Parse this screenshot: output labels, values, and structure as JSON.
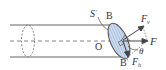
{
  "diagram": {
    "labels": {
      "s_prime": "S",
      "s_prime_mark": "'",
      "b_top": "B",
      "b_bottom": "B",
      "b_bottom_mark": "'",
      "origin": "O",
      "force": "F",
      "force_v": "F",
      "force_v_sub": "v",
      "force_h": "F",
      "force_h_sub": "h",
      "angle": "θ"
    },
    "colors": {
      "line": "#555555",
      "ellipse_fill": "#c9d9ee",
      "hatch": "#7f9fc8",
      "text": "#333333"
    }
  }
}
